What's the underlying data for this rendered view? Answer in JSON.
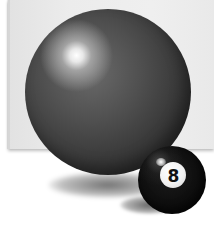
{
  "scene": {
    "description": "Large glossy dark gray sphere in front of a light gray panel, with a small black 8-ball in the lower right foreground",
    "colors": {
      "panel": "#ececec",
      "background": "#ffffff",
      "big_ball": "#4a4a4a",
      "eight_ball": "#0d0d0d",
      "eight_spot": "#f2f2f2"
    }
  },
  "eight_ball": {
    "number": "8"
  }
}
